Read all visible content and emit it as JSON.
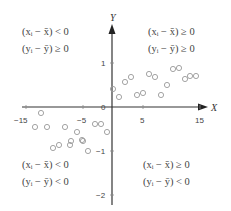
{
  "chart_data": {
    "type": "scatter",
    "title": "",
    "xlabel": "X",
    "ylabel": "Y",
    "xlim": [
      -15,
      16
    ],
    "ylim": [
      -2.2,
      1.9
    ],
    "x_ticks": [
      -15,
      -5,
      5,
      15
    ],
    "x_tick_labels": [
      "−15",
      "−5",
      "5",
      "15"
    ],
    "y_ticks": [
      1,
      0,
      -1,
      -2
    ],
    "y_tick_labels": [
      "1",
      "0",
      "−1",
      "−2"
    ],
    "grid": false,
    "legend": null,
    "series": [
      {
        "name": "points",
        "marker": "open-circle",
        "color": "#9a9a9a",
        "points": [
          [
            0.2,
            0.41
          ],
          [
            1.2,
            0.23
          ],
          [
            2.2,
            0.57
          ],
          [
            3.2,
            0.68
          ],
          [
            4.3,
            0.27
          ],
          [
            5.3,
            0.32
          ],
          [
            6.4,
            0.75
          ],
          [
            7.4,
            0.68
          ],
          [
            8.5,
            0.27
          ],
          [
            9.6,
            0.5
          ],
          [
            10.6,
            0.86
          ],
          [
            11.7,
            0.89
          ],
          [
            12.7,
            0.64
          ],
          [
            13.6,
            0.7
          ],
          [
            14.6,
            0.7
          ],
          [
            -17.5,
            -0.14
          ],
          [
            -18.5,
            -0.45
          ],
          [
            -16.5,
            -0.45
          ],
          [
            -13.3,
            -0.45
          ],
          [
            -11.2,
            -0.57
          ],
          [
            -12.3,
            -0.77
          ],
          [
            -10.2,
            -0.77
          ],
          [
            -15.4,
            -0.93
          ],
          [
            -14.4,
            -0.86
          ],
          [
            -12.5,
            -0.86
          ],
          [
            -10.4,
            -0.75
          ],
          [
            -9.3,
            -1.0
          ],
          [
            -8.1,
            -0.39
          ],
          [
            -7.0,
            -0.39
          ],
          [
            -6.0,
            -0.57
          ]
        ]
      }
    ],
    "annotations": [
      {
        "quadrant": "upper-left",
        "lines": [
          "(xᵢ − x̄) < 0",
          "(yᵢ − ȳ) ≥ 0"
        ]
      },
      {
        "quadrant": "upper-right",
        "lines": [
          "(xᵢ − x̄) ≥ 0",
          "(yᵢ − ȳ) ≥ 0"
        ]
      },
      {
        "quadrant": "lower-left",
        "lines": [
          "(xᵢ − x̄) < 0",
          "(yᵢ − ȳ) < 0"
        ]
      },
      {
        "quadrant": "lower-right",
        "lines": [
          "(xᵢ − x̄) ≥ 0",
          "(yᵢ − ȳ) < 0"
        ]
      }
    ]
  },
  "axes": {
    "x_label": "X",
    "y_label": "Y",
    "origin_label": "0"
  },
  "quadrants": {
    "ul": {
      "line1": "(xᵢ − x̄) < 0",
      "line2": "(yᵢ − ȳ) ≥ 0"
    },
    "ur": {
      "line1": "(xᵢ − x̄) ≥ 0",
      "line2": "(yᵢ − ȳ) ≥ 0"
    },
    "ll": {
      "line1": "(xᵢ − x̄) < 0",
      "line2": "(yᵢ − ȳ) < 0"
    },
    "lr": {
      "line1": "(xᵢ − x̄) ≥ 0",
      "line2": "(yᵢ − ȳ) < 0"
    }
  },
  "ticks": {
    "x": [
      "−15",
      "−5",
      "5",
      "15"
    ],
    "y": [
      "1",
      "−1",
      "−2"
    ]
  },
  "pixel_points": [
    [
      113,
      89
    ],
    [
      119,
      97
    ],
    [
      125,
      82
    ],
    [
      131,
      77
    ],
    [
      137,
      95
    ],
    [
      143,
      93
    ],
    [
      149,
      74
    ],
    [
      155,
      77
    ],
    [
      161,
      95
    ],
    [
      167,
      85
    ],
    [
      173,
      69
    ],
    [
      179,
      68
    ],
    [
      185,
      79
    ],
    [
      190,
      76
    ],
    [
      196,
      76
    ],
    [
      41,
      113
    ],
    [
      35,
      127
    ],
    [
      47,
      127
    ],
    [
      65,
      127
    ],
    [
      77,
      132
    ],
    [
      71,
      141
    ],
    [
      83,
      141
    ],
    [
      53,
      148
    ],
    [
      59,
      145
    ],
    [
      70,
      145
    ],
    [
      82,
      140
    ],
    [
      88,
      151
    ],
    [
      95,
      124
    ],
    [
      101,
      124
    ],
    [
      107,
      132
    ]
  ]
}
